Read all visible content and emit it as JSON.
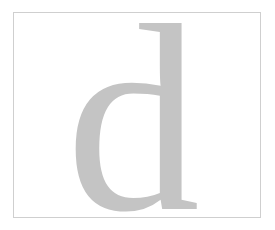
{
  "page": {
    "background_color": "#ffffff",
    "width": 275,
    "height": 230
  },
  "frame": {
    "border_color": "#cfcfcf",
    "border_width_px": 1,
    "fill_color": "#ffffff",
    "left": 13,
    "top": 12,
    "width": 248,
    "height": 206
  },
  "glyph": {
    "character": "d",
    "label": "lowercase-letter-d",
    "color": "#c4c4c4",
    "typeface_style": "serif",
    "font_size_px": 268,
    "x": 52,
    "y": 196,
    "description": "Large light gray serif lowercase d with flat top serif on the ascender and a serif foot at the baseline"
  }
}
